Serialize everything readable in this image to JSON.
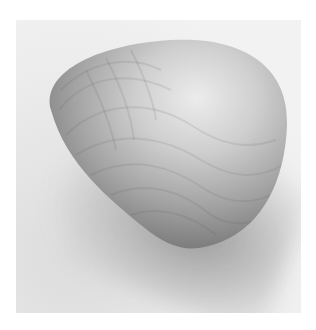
{
  "image": {
    "subject": "smooth rounded triangular wooden stone",
    "alt": "Grayscale photo of a smooth, rounded triangular wooden object with visible grain, casting a soft shadow on a light background",
    "colors": {
      "background": "#f0f0f0",
      "object_highlight": "#e6e6e6",
      "object_mid": "#a8a8a8",
      "object_dark": "#6e6e6e",
      "shadow": "#8a8a8a",
      "border": "#ffffff"
    }
  }
}
